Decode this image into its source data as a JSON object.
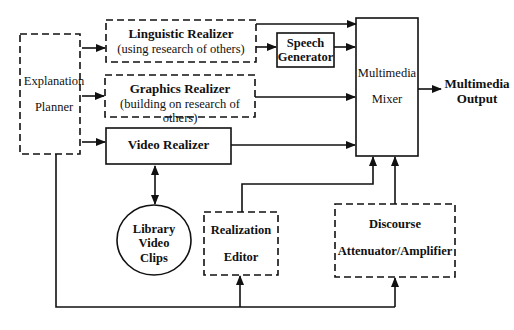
{
  "diagram": {
    "nodes": {
      "explanation_planner": {
        "line1": "Explanation",
        "line2": "Planner",
        "style": "dashed"
      },
      "linguistic_realizer": {
        "title": "Linguistic Realizer",
        "subtitle": "(using research of others)",
        "style": "dashed"
      },
      "graphics_realizer": {
        "title": "Graphics Realizer",
        "subtitle": "(building on research of others)",
        "style": "dashed"
      },
      "video_realizer": {
        "title": "Video Realizer",
        "style": "solid"
      },
      "speech_generator": {
        "line1": "Speech",
        "line2": "Generator",
        "style": "solid"
      },
      "multimedia_mixer": {
        "line1": "Multimedia",
        "line2": "Mixer",
        "style": "solid"
      },
      "multimedia_output": {
        "line1": "Multimedia",
        "line2": "Output"
      },
      "library_video_clips": {
        "line1": "Library",
        "line2": "Video",
        "line3": "Clips",
        "shape": "circle"
      },
      "realization_editor": {
        "line1": "Realization",
        "line2": "Editor",
        "style": "dashed"
      },
      "discourse_attenuator": {
        "line1": "Discourse",
        "line2": "Attenuator/Amplifier",
        "style": "dashed"
      }
    },
    "edges": [
      {
        "from": "Explanation Planner",
        "to": "Linguistic Realizer"
      },
      {
        "from": "Explanation Planner",
        "to": "Graphics Realizer"
      },
      {
        "from": "Explanation Planner",
        "to": "Video Realizer"
      },
      {
        "from": "Explanation Planner",
        "to": "Realization Editor"
      },
      {
        "from": "Explanation Planner",
        "to": "Discourse Attenuator/Amplifier"
      },
      {
        "from": "Linguistic Realizer",
        "to": "Multimedia Mixer"
      },
      {
        "from": "Linguistic Realizer",
        "to": "Speech Generator"
      },
      {
        "from": "Speech Generator",
        "to": "Multimedia Mixer"
      },
      {
        "from": "Graphics Realizer",
        "to": "Multimedia Mixer"
      },
      {
        "from": "Video Realizer",
        "to": "Multimedia Mixer"
      },
      {
        "from": "Video Realizer",
        "to": "Library Video Clips",
        "bidirectional": true
      },
      {
        "from": "Realization Editor",
        "to": "Multimedia Mixer"
      },
      {
        "from": "Discourse Attenuator/Amplifier",
        "to": "Multimedia Mixer"
      },
      {
        "from": "Multimedia Mixer",
        "to": "Multimedia Output"
      }
    ]
  }
}
